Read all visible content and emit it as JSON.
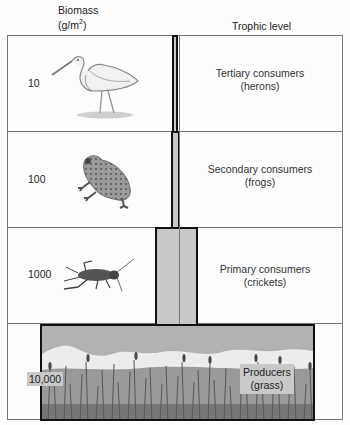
{
  "headers": {
    "biomass_line1": "Biomass",
    "biomass_line2_prefix": "(g/m",
    "biomass_line2_sup": "2",
    "biomass_line2_suffix": ")",
    "trophic_level": "Trophic level"
  },
  "levels": [
    {
      "biomass": "10",
      "name": "Tertiary consumers",
      "example": "(herons)",
      "icon": "heron-icon"
    },
    {
      "biomass": "100",
      "name": "Secondary consumers",
      "example": "(frogs)",
      "icon": "frog-icon"
    },
    {
      "biomass": "1000",
      "name": "Primary consumers",
      "example": "(crickets)",
      "icon": "cricket-icon"
    },
    {
      "biomass": "10,000",
      "name": "Producers",
      "example": "(grass)",
      "icon": "grass-icon"
    }
  ],
  "colors": {
    "pillar_fill": "#c8c8c8",
    "pillar_border": "#111111",
    "frame_line": "#777777"
  }
}
